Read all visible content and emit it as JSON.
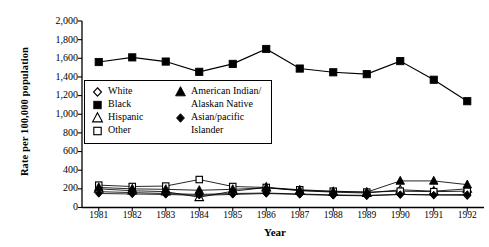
{
  "chart_data": {
    "type": "line",
    "title": "",
    "xlabel": "Year",
    "ylabel": "Rate per 100,000 population",
    "categories": [
      "1981",
      "1982",
      "1983",
      "1984",
      "1985",
      "1986",
      "1987",
      "1988",
      "1989",
      "1990",
      "1991",
      "1992"
    ],
    "ylim": [
      0,
      2000
    ],
    "yticks": [
      "0",
      "200",
      "400",
      "600",
      "800",
      "1,000",
      "1,200",
      "1,400",
      "1,600",
      "1,800",
      "2,000"
    ],
    "ytick_values": [
      0,
      200,
      400,
      600,
      800,
      1000,
      1200,
      1400,
      1600,
      1800,
      2000
    ],
    "grid": false,
    "legend_position": "inside-upper-left",
    "series": [
      {
        "name": "White",
        "marker": "open-diamond",
        "values": [
          170,
          160,
          150,
          140,
          150,
          155,
          145,
          135,
          130,
          140,
          135,
          130
        ]
      },
      {
        "name": "Black",
        "marker": "filled-square",
        "values": [
          1560,
          1610,
          1565,
          1455,
          1540,
          1700,
          1490,
          1450,
          1430,
          1570,
          1370,
          1140
        ]
      },
      {
        "name": "Hispanic",
        "marker": "open-triangle",
        "values": [
          200,
          180,
          170,
          110,
          175,
          215,
          180,
          165,
          155,
          190,
          175,
          200
        ]
      },
      {
        "name": "Other",
        "marker": "open-square",
        "values": [
          240,
          225,
          230,
          300,
          225,
          215,
          190,
          175,
          165,
          175,
          170,
          175
        ]
      },
      {
        "name": "American Indian/Alaskan Native",
        "marker": "filled-triangle",
        "values": [
          215,
          200,
          195,
          185,
          195,
          210,
          185,
          170,
          165,
          285,
          285,
          245
        ]
      },
      {
        "name": "Asian/pacific Islander",
        "marker": "filled-diamond",
        "values": [
          150,
          145,
          140,
          130,
          140,
          150,
          140,
          130,
          125,
          140,
          135,
          140
        ]
      }
    ]
  },
  "legend": {
    "entries": [
      {
        "label": "White",
        "marker": "open-diamond"
      },
      {
        "label": "Black",
        "marker": "filled-square"
      },
      {
        "label": "Hispanic",
        "marker": "open-triangle"
      },
      {
        "label": "Other",
        "marker": "open-square"
      },
      {
        "label": "American Indian/",
        "label2": "Alaskan Native",
        "marker": "filled-triangle"
      },
      {
        "label": "Asian/pacific",
        "label2": "Islander",
        "marker": "filled-diamond"
      }
    ]
  },
  "colors": {
    "ink": "#000000",
    "background": "#ffffff"
  }
}
